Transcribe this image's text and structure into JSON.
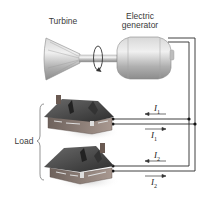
{
  "labels": {
    "turbine": "Turbine",
    "generator_line1": "Electric",
    "generator_line2": "generator",
    "load": "Load"
  },
  "currents": [
    {
      "name": "I",
      "sub": "1",
      "direction": "left",
      "position": "above-house-1-line"
    },
    {
      "name": "I",
      "sub": "1",
      "direction": "right",
      "position": "below-house-1-line"
    },
    {
      "name": "I",
      "sub": "2",
      "direction": "left",
      "position": "above-house-2-line"
    },
    {
      "name": "I",
      "sub": "2",
      "direction": "right",
      "position": "below-house-2-line"
    }
  ],
  "components": {
    "turbine": "turbine",
    "generator": "electric generator",
    "loads": [
      "house 1",
      "house 2"
    ]
  },
  "colors": {
    "wire": "#2a2a2a",
    "metal": "#b8b8b8",
    "roof": "#4a4a4a",
    "wall": "#8a7a72"
  }
}
